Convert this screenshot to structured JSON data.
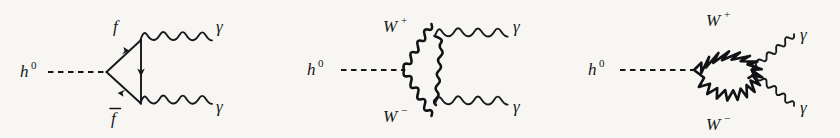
{
  "figure": {
    "name": "higgs-to-diphoton-feynman-diagrams",
    "background_color": "#f7f6f3",
    "ink_color": "#16161a",
    "width": 840,
    "height": 138
  },
  "diagrams": [
    {
      "id": "fermion-triangle-loop",
      "incoming_label": "h",
      "incoming_sup": "0",
      "loop_top_label": "f",
      "loop_bottom_label": "f",
      "loop_bottom_has_overline": true,
      "outgoing_top_label": "γ",
      "outgoing_bottom_label": "γ",
      "propagator_style": "solid-fermion-with-arrows",
      "incoming_style": "dashed"
    },
    {
      "id": "w-boson-triangle-loop",
      "incoming_label": "h",
      "incoming_sup": "0",
      "loop_top_label": "W",
      "loop_top_sup": "+",
      "loop_bottom_label": "W",
      "loop_bottom_sup": "−",
      "outgoing_top_label": "γ",
      "outgoing_bottom_label": "γ",
      "propagator_style": "wavy-boson",
      "incoming_style": "dashed"
    },
    {
      "id": "w-boson-bubble-loop",
      "incoming_label": "h",
      "incoming_sup": "0",
      "loop_top_label": "W",
      "loop_top_sup": "+",
      "loop_bottom_label": "W",
      "loop_bottom_sup": "−",
      "outgoing_top_label": "γ",
      "outgoing_bottom_label": "γ",
      "propagator_style": "wavy-boson-circular-loop",
      "incoming_style": "dashed"
    }
  ]
}
